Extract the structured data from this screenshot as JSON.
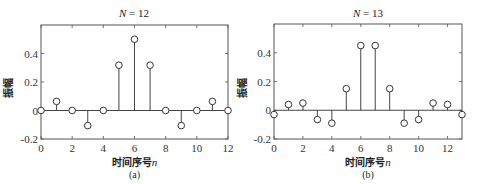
{
  "chart_data": [
    {
      "type": "stem",
      "title": "N = 12",
      "title_var": "N",
      "title_value": "= 12",
      "caption": "(a)",
      "xlabel": "时间序号n",
      "xlabel_text": "时间序号",
      "xlabel_var": "n",
      "ylabel": "振幅",
      "xlim": [
        0,
        12
      ],
      "ylim": [
        -0.2,
        0.6
      ],
      "xticks": [
        0,
        2,
        4,
        6,
        8,
        10,
        12
      ],
      "xtick_labels": [
        "0",
        "2",
        "4",
        "6",
        "8",
        "10",
        "12"
      ],
      "yticks": [
        -0.2,
        0,
        0.2,
        0.4
      ],
      "ytick_labels": [
        "-0.2",
        "0",
        "0.2",
        "0.4"
      ],
      "grid": false,
      "x": [
        0,
        1,
        2,
        3,
        4,
        5,
        6,
        7,
        8,
        9,
        10,
        11,
        12
      ],
      "values": [
        0,
        0.064,
        0,
        -0.106,
        0,
        0.318,
        0.5,
        0.318,
        0,
        -0.106,
        0,
        0.064,
        0
      ]
    },
    {
      "type": "stem",
      "title": "N = 13",
      "title_var": "N",
      "title_value": "= 13",
      "caption": "(b)",
      "xlabel": "时间序号n",
      "xlabel_text": "时间序号",
      "xlabel_var": "n",
      "ylabel": "振幅",
      "xlim": [
        0,
        13
      ],
      "ylim": [
        -0.2,
        0.6
      ],
      "xticks": [
        0,
        2,
        4,
        6,
        8,
        10,
        12
      ],
      "xtick_labels": [
        "0",
        "2",
        "4",
        "6",
        "8",
        "10",
        "12"
      ],
      "yticks": [
        -0.2,
        0,
        0.2,
        0.4
      ],
      "ytick_labels": [
        "-0.2",
        "0",
        "0.2",
        "0.4"
      ],
      "grid": false,
      "x": [
        0,
        1,
        2,
        3,
        4,
        5,
        6,
        7,
        8,
        9,
        10,
        11,
        12,
        13
      ],
      "values": [
        -0.03,
        0.04,
        0.05,
        -0.065,
        -0.09,
        0.15,
        0.45,
        0.45,
        0.15,
        -0.09,
        -0.065,
        0.05,
        0.04,
        -0.03
      ]
    }
  ],
  "colors": {
    "axis": "#555555",
    "stem": "#444444",
    "marker": "#333333"
  }
}
